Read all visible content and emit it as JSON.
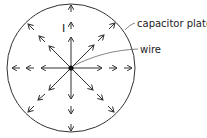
{
  "diagram": {
    "labels": {
      "current": "I",
      "plate": "capacitor plate",
      "wire": "wire"
    },
    "colors": {
      "stroke": "#333333",
      "text": "#222222",
      "background": "#ffffff"
    },
    "plate": {
      "cx": 71,
      "cy": 68,
      "r": 64
    },
    "directions": 8
  }
}
